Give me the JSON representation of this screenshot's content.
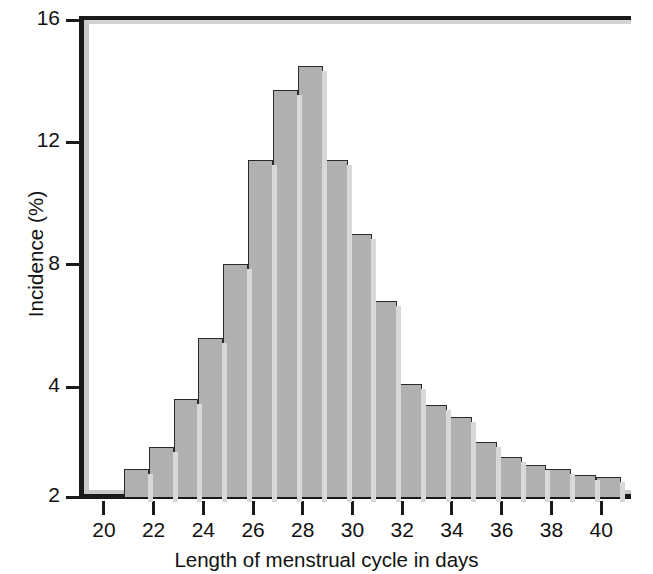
{
  "figure": {
    "background": "#ffffff",
    "bar_fill": "#b0b0b0",
    "bar_edge": "#2a2a2a",
    "axis_color": "#1a1a1a"
  },
  "axes": {
    "xlabel": "Length of menstrual cycle in days",
    "ylabel": "Incidence (%)",
    "x_ticks": [
      "20",
      "22",
      "24",
      "26",
      "28",
      "30",
      "32",
      "34",
      "36",
      "38",
      "40"
    ],
    "y_ticks": [
      "2",
      "4",
      "8",
      "12",
      "16"
    ]
  },
  "chart_data": {
    "type": "bar",
    "title": "",
    "subtitle": "",
    "xlabel": "Length of menstrual cycle in days",
    "ylabel": "Incidence (%)",
    "xlim": [
      19.2,
      41.2
    ],
    "ylim": [
      0,
      16
    ],
    "xtick_values": [
      20,
      22,
      24,
      26,
      28,
      30,
      32,
      34,
      36,
      38,
      40
    ],
    "xtick_labels": [
      "20",
      "22",
      "24",
      "26",
      "28",
      "30",
      "32",
      "34",
      "36",
      "38",
      "40"
    ],
    "ytick_values": [
      2,
      4,
      8,
      12,
      16
    ],
    "ytick_labels": [
      "2",
      "4",
      "8",
      "12",
      "16"
    ],
    "grid": false,
    "legend": null,
    "annotations": [],
    "bin_width": 1,
    "categories": [
      "20.8",
      "21.8",
      "22.8",
      "23.8",
      "24.8",
      "25.8",
      "26.8",
      "27.8",
      "28.8",
      "29.8",
      "30.8",
      "31.8",
      "32.8",
      "33.8",
      "34.8",
      "35.8",
      "36.8",
      "37.8",
      "38.8",
      "39.8"
    ],
    "bin_starts": [
      20.8,
      21.8,
      22.8,
      23.8,
      24.8,
      25.8,
      26.8,
      27.8,
      28.8,
      29.8,
      30.8,
      31.8,
      32.8,
      33.8,
      34.8,
      35.8,
      36.8,
      37.8,
      38.8,
      39.8
    ],
    "values": [
      0.9,
      1.65,
      3.2,
      5.2,
      7.6,
      11.0,
      13.3,
      14.1,
      11.0,
      8.6,
      6.4,
      3.7,
      3.0,
      2.6,
      1.8,
      1.3,
      1.05,
      0.9,
      0.72,
      0.65
    ],
    "values_as_labelled": [
      2.9,
      3.7,
      5.2,
      7.2,
      9.6,
      13.0,
      15.3,
      16.1,
      13.0,
      10.6,
      8.4,
      5.7,
      5.0,
      4.6,
      3.8,
      3.3,
      3.05,
      2.9,
      2.72,
      2.65
    ],
    "reading_note": "Bar heights read against the labelled axis (2,4,8,12,16); the baseline of the plot carries the label 2."
  }
}
